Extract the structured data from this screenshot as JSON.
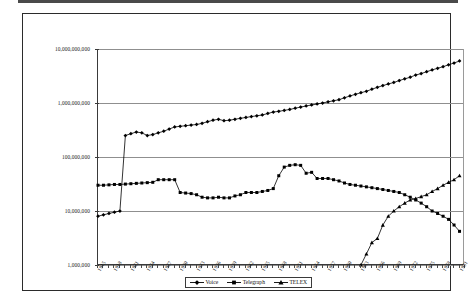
{
  "chart": {
    "title": "",
    "y_axis": {
      "scale": "log",
      "min": 1000000,
      "max": 10000000000,
      "tick_labels": [
        "10,000,000,000",
        "1,000,000,000",
        "100,000,000",
        "10,000,000",
        "1,000,000"
      ],
      "tick_values": [
        10000000000,
        1000000000,
        100000000,
        10000000,
        1000000
      ]
    },
    "x_axis": {
      "tick_labels": [
        "1915",
        "1918",
        "1921",
        "1924",
        "1927",
        "1930",
        "1933",
        "1936",
        "1939",
        "1942",
        "1945",
        "1948",
        "1951",
        "1954",
        "1957",
        "1960",
        "1963",
        "1966",
        "1969",
        "1972",
        "1975",
        "1978",
        "1981"
      ],
      "min": 1915,
      "max": 1982
    },
    "legend": {
      "position": "bottom-center",
      "entries": [
        {
          "label": "Voice",
          "marker": "diamond",
          "color": "#000000"
        },
        {
          "label": "Telegraph",
          "marker": "square",
          "color": "#000000"
        },
        {
          "label": "TELEX",
          "marker": "triangle",
          "color": "#000000"
        }
      ]
    }
  },
  "chart_data": {
    "type": "line",
    "title": "",
    "xlabel": "",
    "ylabel": "",
    "yscale": "log",
    "ylim": [
      1000000,
      10000000000
    ],
    "xlim": [
      1915,
      1982
    ],
    "grid": true,
    "legend_position": "bottom-center",
    "x": [
      1915,
      1916,
      1917,
      1918,
      1919,
      1920,
      1921,
      1922,
      1923,
      1924,
      1925,
      1926,
      1927,
      1928,
      1929,
      1930,
      1931,
      1932,
      1933,
      1934,
      1935,
      1936,
      1937,
      1938,
      1939,
      1940,
      1941,
      1942,
      1943,
      1944,
      1945,
      1946,
      1947,
      1948,
      1949,
      1950,
      1951,
      1952,
      1953,
      1954,
      1955,
      1956,
      1957,
      1958,
      1959,
      1960,
      1961,
      1962,
      1963,
      1964,
      1965,
      1966,
      1967,
      1968,
      1969,
      1970,
      1971,
      1972,
      1973,
      1974,
      1975,
      1976,
      1977,
      1978,
      1979,
      1980,
      1981
    ],
    "series": [
      {
        "name": "Voice",
        "marker": "diamond",
        "color": "#000000",
        "values": [
          8000000,
          8500000,
          9000000,
          9500000,
          10000000,
          250000000,
          270000000,
          290000000,
          280000000,
          250000000,
          260000000,
          280000000,
          300000000,
          330000000,
          360000000,
          370000000,
          380000000,
          390000000,
          400000000,
          420000000,
          450000000,
          480000000,
          500000000,
          470000000,
          480000000,
          500000000,
          520000000,
          540000000,
          560000000,
          580000000,
          600000000,
          640000000,
          680000000,
          700000000,
          730000000,
          760000000,
          800000000,
          840000000,
          880000000,
          920000000,
          960000000,
          1000000000,
          1050000000,
          1100000000,
          1150000000,
          1250000000,
          1350000000,
          1450000000,
          1550000000,
          1650000000,
          1800000000,
          1950000000,
          2100000000,
          2250000000,
          2400000000,
          2600000000,
          2800000000,
          3000000000,
          3300000000,
          3500000000,
          3800000000,
          4100000000,
          4400000000,
          4700000000,
          5100000000,
          5500000000,
          6000000000
        ]
      },
      {
        "name": "Telegraph",
        "marker": "square",
        "color": "#000000",
        "values": [
          30000000,
          30000000,
          30500000,
          31000000,
          31000000,
          31500000,
          32000000,
          32500000,
          33000000,
          33500000,
          34000000,
          38000000,
          38000000,
          38000000,
          38000000,
          22000000,
          21500000,
          21000000,
          20000000,
          18000000,
          17500000,
          17500000,
          18000000,
          17500000,
          17500000,
          19000000,
          20000000,
          22000000,
          22000000,
          22000000,
          23000000,
          24000000,
          26000000,
          45000000,
          65000000,
          70000000,
          72000000,
          70000000,
          50000000,
          52000000,
          40000000,
          40000000,
          40000000,
          38000000,
          36000000,
          33000000,
          31000000,
          30000000,
          29000000,
          28000000,
          27000000,
          26000000,
          25000000,
          24000000,
          23000000,
          22000000,
          20000000,
          18000000,
          16000000,
          14000000,
          12000000,
          10000000,
          9000000,
          8000000,
          7000000,
          5500000,
          4200000
        ]
      },
      {
        "name": "TELEX",
        "marker": "triangle",
        "color": "#000000",
        "values": [
          null,
          null,
          null,
          null,
          null,
          null,
          null,
          null,
          null,
          null,
          null,
          null,
          null,
          null,
          null,
          null,
          null,
          null,
          null,
          null,
          null,
          null,
          null,
          null,
          null,
          null,
          null,
          null,
          null,
          null,
          null,
          null,
          null,
          null,
          null,
          null,
          null,
          null,
          null,
          null,
          null,
          null,
          null,
          null,
          null,
          null,
          null,
          null,
          1000000,
          1600000,
          2600000,
          3100000,
          5500000,
          8000000,
          10000000,
          12000000,
          14000000,
          16000000,
          17000000,
          18500000,
          20000000,
          23000000,
          26000000,
          30000000,
          34000000,
          38000000,
          45000000
        ]
      }
    ]
  }
}
